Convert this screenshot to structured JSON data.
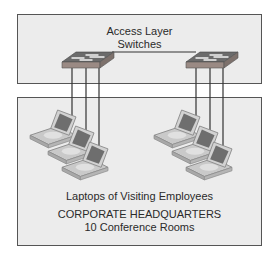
{
  "top_section": {
    "title_line1": "Access Layer",
    "title_line2": "Switches"
  },
  "bottom_section": {
    "laptops_label": "Laptops of Visiting Employees",
    "location_title": "CORPORATE HEADQUARTERS",
    "location_subtitle": "10 Conference Rooms"
  },
  "devices": {
    "switches": [
      {
        "name": "switch-left",
        "icon": "switch-icon"
      },
      {
        "name": "switch-right",
        "icon": "switch-icon"
      }
    ],
    "laptop_groups": [
      {
        "name": "laptop-group-left",
        "count": 3,
        "icon": "laptop-icon"
      },
      {
        "name": "laptop-group-right",
        "count": 3,
        "icon": "laptop-icon"
      }
    ]
  },
  "colors": {
    "box_fill": "#ececec",
    "box_border": "#555555",
    "switch_top": "#6b6b6b",
    "switch_front": "#9a8a84",
    "cable": "#333333"
  }
}
